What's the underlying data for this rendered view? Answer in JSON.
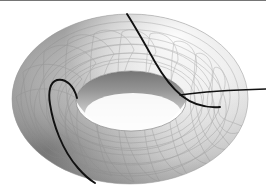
{
  "figure": {
    "caption": "",
    "background_color": "#ffffff",
    "border": {
      "top_rule_color": "#5d5d5d",
      "top_rule_height_px": 1
    },
    "canvas": {
      "width_px": 266,
      "height_px": 188
    }
  },
  "object": {
    "name": "torus",
    "shape_kind": "torus",
    "rendering": "smooth-shaded grayscale surface with hidden-line wireframe",
    "view": "oblique from above, viewing elevation approximately 35 degrees",
    "bounds_px": {
      "left": 12,
      "top": 14,
      "right": 249,
      "bottom": 184
    },
    "outer_ellipse_px": {
      "cx": 130,
      "cy": 99,
      "rx": 118,
      "ry": 85
    },
    "hole_ellipse_px": {
      "cx": 131,
      "cy": 101,
      "rx": 55,
      "ry": 30
    },
    "colors": {
      "highlight": "#ffffff",
      "body_light": "#f4f4f4",
      "body_mid": "#d8d8d8",
      "body_shade": "#a8a8a8",
      "body_dark": "#6f6f6f",
      "terminator": "#4a4a4a",
      "inner_wall_dark": "#808080",
      "hole_interior": "#fbfbfb",
      "wireframe": "#8a8a8a",
      "geodesic": "#111111"
    },
    "light_direction": "upper right"
  },
  "wireframe": {
    "label": "parametric grid on the torus surface",
    "meridian_count": 24,
    "parallel_count": 12,
    "line_color": "#8a8a8a",
    "line_width_px": 0.6,
    "opacity": 0.55
  },
  "geodesics": [
    {
      "name": "left-meridian-curve",
      "description": "Black curve looping over the left lobe of the torus, passing from the inner hole edge around the outer body and down to the lower left",
      "color": "#111111",
      "width_px": 1.8
    },
    {
      "name": "upper-right-descending-curve",
      "description": "Black curve descending from the top of the torus through the upper right quadrant into the inner hole",
      "color": "#111111",
      "width_px": 1.8
    },
    {
      "name": "right-horizontal-tangent-line",
      "description": "Black near-horizontal line crossing the right lobe and extending to the right edge of the frame",
      "color": "#111111",
      "width_px": 1.6
    }
  ]
}
